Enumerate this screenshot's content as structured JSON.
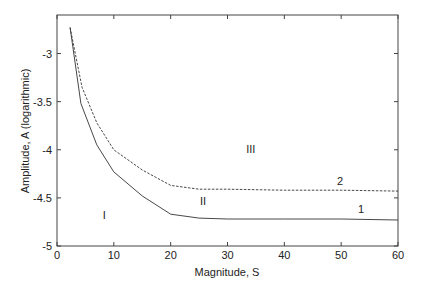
{
  "chart_data": {
    "type": "line",
    "title": "",
    "xlabel": "Magnitude, S",
    "ylabel": "Amplitude, A (logarithmic)",
    "xlim": [
      0,
      60
    ],
    "ylim": [
      -5,
      -2.6
    ],
    "xticks": [
      0,
      10,
      20,
      30,
      40,
      50,
      60
    ],
    "xtick_labels": [
      "0",
      "10",
      "20",
      "30",
      "40",
      "50",
      "60"
    ],
    "yticks": [
      -5,
      -4.5,
      -4,
      -3.5,
      -3
    ],
    "ytick_labels": [
      "-5",
      "-4.5",
      "-4",
      "-3.5",
      "-3"
    ],
    "grid": false,
    "legend": null,
    "series": [
      {
        "name": "1",
        "style": "solid",
        "color": "#333333",
        "x": [
          2.3,
          4.2,
          7,
          10,
          15,
          20,
          25,
          30,
          40,
          50,
          60
        ],
        "y": [
          -2.73,
          -3.52,
          -3.95,
          -4.23,
          -4.48,
          -4.67,
          -4.71,
          -4.72,
          -4.72,
          -4.72,
          -4.73
        ]
      },
      {
        "name": "2",
        "style": "dashed",
        "color": "#333333",
        "x": [
          2.3,
          4.4,
          7,
          10,
          15,
          20,
          25,
          30,
          40,
          50,
          60
        ],
        "y": [
          -2.73,
          -3.35,
          -3.72,
          -4.0,
          -4.21,
          -4.37,
          -4.41,
          -4.41,
          -4.42,
          -4.42,
          -4.43
        ]
      }
    ],
    "annotations": [
      {
        "text": "1",
        "x": 53.5,
        "y": -4.66
      },
      {
        "text": "2",
        "x": 49.8,
        "y": -4.37
      },
      {
        "text": "I",
        "x": 8.3,
        "y": -4.72
      },
      {
        "text": "II",
        "x": 25.7,
        "y": -4.57
      },
      {
        "text": "III",
        "x": 34.1,
        "y": -4.03
      }
    ]
  }
}
